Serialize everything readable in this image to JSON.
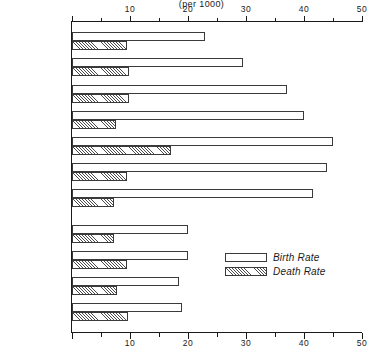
{
  "chart_data": {
    "type": "bar",
    "title": "(per 1000)",
    "orientation": "horizontal",
    "xlabel": "",
    "ylabel": "",
    "xlim": [
      0,
      50
    ],
    "xticks": [
      0,
      10,
      20,
      30,
      40,
      50
    ],
    "xtick_labels": [
      "",
      "10",
      "20",
      "30",
      "40",
      "50"
    ],
    "minor_tick_interval": 5,
    "grid": false,
    "axis_labels_top": true,
    "axis_labels_bottom": true,
    "legend_position": "inside-lower-right",
    "categories": [
      "Argentina",
      "Chile",
      "Colombia",
      "Costa Rica",
      "Guatemala",
      "Mexico",
      "Venezuela",
      "Japan",
      "Australia",
      "Canada",
      "U.S.A."
    ],
    "group_gap_after": "Venezuela",
    "series": [
      {
        "name": "Birth Rate",
        "style": "open",
        "values": [
          23.0,
          29.5,
          37.0,
          40.0,
          45.0,
          44.0,
          41.5,
          20.0,
          20.0,
          18.5,
          19.0
        ]
      },
      {
        "name": "Death Rate",
        "style": "hatched",
        "values": [
          9.5,
          9.8,
          9.8,
          7.5,
          17.0,
          9.5,
          7.2,
          7.3,
          9.5,
          7.8,
          9.7
        ]
      }
    ]
  },
  "legend": {
    "items": [
      {
        "label": "Birth Rate",
        "style": "open"
      },
      {
        "label": "Death Rate",
        "style": "hatched"
      }
    ]
  },
  "colors": {
    "ink": "#1a1a1a",
    "bar_outline": "#3a3a3a",
    "hatch": "#4a4a4a",
    "background": "#ffffff"
  }
}
